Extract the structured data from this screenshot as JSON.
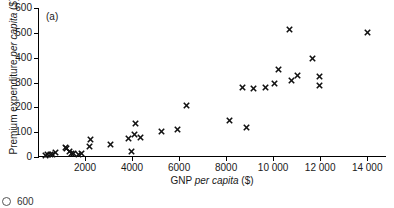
{
  "figure": {
    "panel_label": "(a)",
    "background_color": "#ffffff",
    "marker_color": "#111111",
    "axis_color": "#000000"
  },
  "next_panel": {
    "bullet": "b-bullet-icon",
    "top_ytick_label": "600"
  },
  "chart_data": {
    "type": "scatter",
    "title": "(a)",
    "xlabel": "GNP per capita ($)",
    "xlabel_plain": "GNP ",
    "xlabel_italic": "per capita",
    "xlabel_tail": " ($)",
    "ylabel": "Premium expenditure per capita ($)",
    "ylabel_plain": "Premium expenditure ",
    "ylabel_italic": "per capita",
    "ylabel_tail": " ($)",
    "xlim": [
      0,
      14800
    ],
    "ylim": [
      0,
      600
    ],
    "grid": false,
    "legend": null,
    "xticks": [
      2000,
      4000,
      6000,
      8000,
      10000,
      12000,
      14000
    ],
    "xtick_labels": [
      "2000",
      "4000",
      "6000",
      "8000",
      "10 000",
      "12 000",
      "14 000"
    ],
    "yticks": [
      0,
      100,
      200,
      300,
      400,
      500,
      600
    ],
    "ytick_labels": [
      "0",
      "100",
      "200",
      "300",
      "400",
      "500",
      "600"
    ],
    "marker": "x",
    "points": [
      [
        330,
        8
      ],
      [
        420,
        10
      ],
      [
        520,
        12
      ],
      [
        610,
        9
      ],
      [
        760,
        18
      ],
      [
        1150,
        40
      ],
      [
        1230,
        33
      ],
      [
        1330,
        22
      ],
      [
        1420,
        16
      ],
      [
        1520,
        14
      ],
      [
        1720,
        12
      ],
      [
        1830,
        13
      ],
      [
        2180,
        43
      ],
      [
        2230,
        72
      ],
      [
        3080,
        52
      ],
      [
        3840,
        73
      ],
      [
        3980,
        24
      ],
      [
        4100,
        91
      ],
      [
        4130,
        136
      ],
      [
        4340,
        78
      ],
      [
        5250,
        101
      ],
      [
        5920,
        111
      ],
      [
        6330,
        207
      ],
      [
        8130,
        148
      ],
      [
        8700,
        279
      ],
      [
        8870,
        119
      ],
      [
        9180,
        274
      ],
      [
        9660,
        280
      ],
      [
        10050,
        296
      ],
      [
        10230,
        353
      ],
      [
        10700,
        512
      ],
      [
        10800,
        309
      ],
      [
        11050,
        327
      ],
      [
        11670,
        396
      ],
      [
        11980,
        326
      ],
      [
        11990,
        288
      ],
      [
        14020,
        501
      ]
    ]
  }
}
